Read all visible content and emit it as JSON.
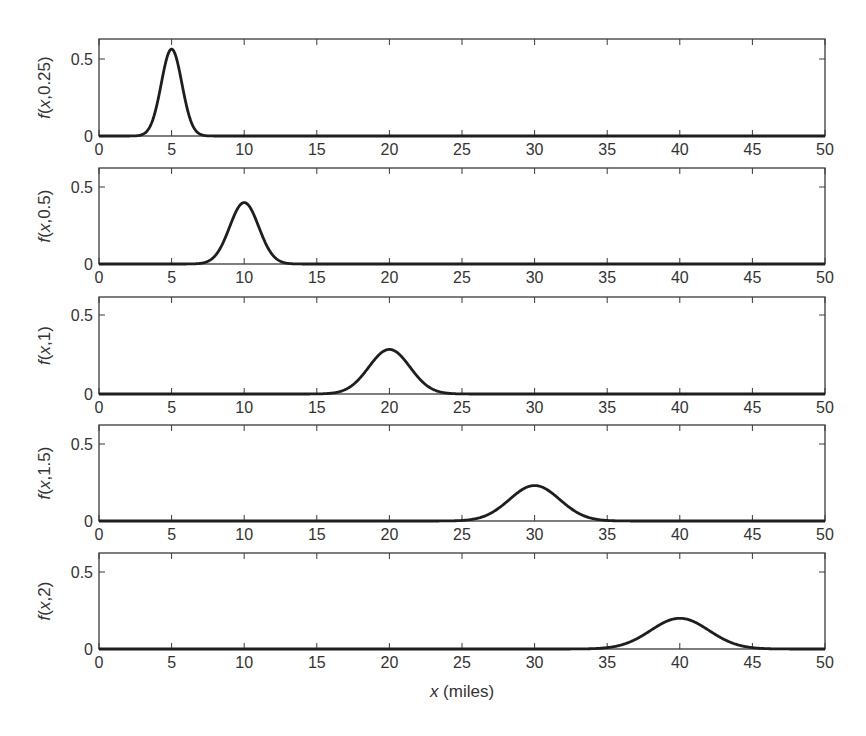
{
  "figure": {
    "xlabel_var": "x",
    "xlabel_unit": " (miles)",
    "bottom_caption_partial": ""
  },
  "chart_data": [
    {
      "type": "line",
      "ylabel": "f(x,0.25)",
      "t": 0.25,
      "xlim": [
        0,
        50
      ],
      "ylim": [
        0,
        0.62
      ],
      "xticks": [
        0,
        5,
        10,
        15,
        20,
        25,
        30,
        35,
        40,
        45,
        50
      ],
      "yticks": [
        0,
        0.5
      ],
      "series": [
        {
          "name": "f(x,0.25)",
          "mean": 5,
          "variance": 0.5,
          "peak": 0.56
        }
      ],
      "grid": false
    },
    {
      "type": "line",
      "ylabel": "f(x,0.5)",
      "t": 0.5,
      "xlim": [
        0,
        50
      ],
      "ylim": [
        0,
        0.62
      ],
      "xticks": [
        0,
        5,
        10,
        15,
        20,
        25,
        30,
        35,
        40,
        45,
        50
      ],
      "yticks": [
        0,
        0.5
      ],
      "series": [
        {
          "name": "f(x,0.5)",
          "mean": 10,
          "variance": 1,
          "peak": 0.4
        }
      ],
      "grid": false
    },
    {
      "type": "line",
      "ylabel": "f(x,1)",
      "t": 1,
      "xlim": [
        0,
        50
      ],
      "ylim": [
        0,
        0.62
      ],
      "xticks": [
        0,
        5,
        10,
        15,
        20,
        25,
        30,
        35,
        40,
        45,
        50
      ],
      "yticks": [
        0,
        0.5
      ],
      "series": [
        {
          "name": "f(x,1)",
          "mean": 20,
          "variance": 2,
          "peak": 0.28
        }
      ],
      "grid": false
    },
    {
      "type": "line",
      "ylabel": "f(x,1.5)",
      "t": 1.5,
      "xlim": [
        0,
        50
      ],
      "ylim": [
        0,
        0.62
      ],
      "xticks": [
        0,
        5,
        10,
        15,
        20,
        25,
        30,
        35,
        40,
        45,
        50
      ],
      "yticks": [
        0,
        0.5
      ],
      "series": [
        {
          "name": "f(x,1.5)",
          "mean": 30,
          "variance": 3,
          "peak": 0.23
        }
      ],
      "grid": false
    },
    {
      "type": "line",
      "ylabel": "f(x,2)",
      "t": 2,
      "xlim": [
        0,
        50
      ],
      "ylim": [
        0,
        0.62
      ],
      "xticks": [
        0,
        5,
        10,
        15,
        20,
        25,
        30,
        35,
        40,
        45,
        50
      ],
      "yticks": [
        0,
        0.5
      ],
      "xlabel": "x (miles)",
      "series": [
        {
          "name": "f(x,2)",
          "mean": 40,
          "variance": 4,
          "peak": 0.2
        }
      ],
      "grid": false
    }
  ],
  "layout": {
    "plot_left": 99,
    "plot_right": 825,
    "panels": [
      {
        "top": 39,
        "zero_y": 136,
        "half_y": 59
      },
      {
        "top": 168,
        "zero_y": 264,
        "half_y": 187
      },
      {
        "top": 297,
        "zero_y": 394,
        "half_y": 315
      },
      {
        "top": 425,
        "zero_y": 521,
        "half_y": 444
      },
      {
        "top": 553,
        "zero_y": 649,
        "half_y": 572
      }
    ]
  }
}
